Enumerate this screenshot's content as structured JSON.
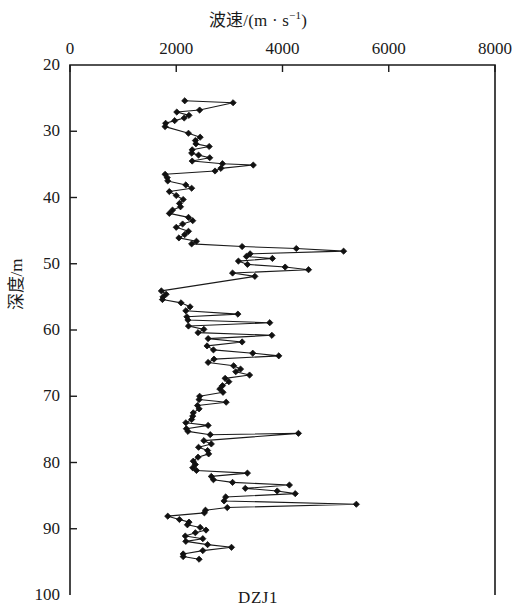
{
  "figure": {
    "caption": "DZJ1",
    "background": "#ffffff",
    "line_color": "#1a1a1a",
    "marker_color": "#111111",
    "axis_color": "#1a1a1a"
  },
  "chart_data": {
    "type": "line",
    "title": "",
    "xlabel_parts": {
      "name": "波速",
      "sep": "/(m · s",
      "sup": "−1",
      "close": ")"
    },
    "xlabel": "波速/(m·s⁻¹)",
    "ylabel": "深度/m",
    "xlim": [
      0,
      8000
    ],
    "ylim": [
      100,
      20
    ],
    "y_inverted": true,
    "xticks": [
      0,
      2000,
      4000,
      6000,
      8000
    ],
    "xticklabels": [
      "0",
      "2000",
      "4000",
      "6000",
      "8000"
    ],
    "yticks": [
      20,
      30,
      40,
      50,
      60,
      70,
      80,
      90,
      100
    ],
    "yticklabels": [
      "20",
      "30",
      "40",
      "50",
      "60",
      "70",
      "80",
      "90",
      "100"
    ],
    "grid": false,
    "legend": null,
    "legend_position": "none",
    "marker": "diamond",
    "series": [
      {
        "name": "DZJ1",
        "xkey": "velocity_m_per_s",
        "ykey": "depth_m",
        "points": [
          [
            2160,
            25.4
          ],
          [
            3070,
            25.7
          ],
          [
            2440,
            26.8
          ],
          [
            2010,
            27.1
          ],
          [
            2240,
            27.6
          ],
          [
            2150,
            28.0
          ],
          [
            1970,
            28.4
          ],
          [
            1800,
            28.8
          ],
          [
            1790,
            29.3
          ],
          [
            2230,
            30.3
          ],
          [
            2450,
            30.9
          ],
          [
            2360,
            31.4
          ],
          [
            2370,
            31.9
          ],
          [
            2620,
            32.3
          ],
          [
            2300,
            32.8
          ],
          [
            2290,
            33.3
          ],
          [
            2420,
            33.6
          ],
          [
            2630,
            34.0
          ],
          [
            2300,
            34.5
          ],
          [
            2870,
            34.9
          ],
          [
            3450,
            35.1
          ],
          [
            2840,
            35.6
          ],
          [
            2730,
            36.0
          ],
          [
            1790,
            36.5
          ],
          [
            1830,
            37.0
          ],
          [
            1840,
            37.5
          ],
          [
            2180,
            38.1
          ],
          [
            2290,
            38.6
          ],
          [
            1870,
            39.1
          ],
          [
            2000,
            39.7
          ],
          [
            2130,
            40.3
          ],
          [
            2060,
            40.9
          ],
          [
            2080,
            41.4
          ],
          [
            1930,
            41.9
          ],
          [
            1870,
            42.4
          ],
          [
            2230,
            43.0
          ],
          [
            2310,
            43.5
          ],
          [
            2120,
            44.0
          ],
          [
            2000,
            44.5
          ],
          [
            2230,
            45.1
          ],
          [
            2160,
            45.6
          ],
          [
            2050,
            46.1
          ],
          [
            2380,
            46.6
          ],
          [
            2290,
            47.0
          ],
          [
            3240,
            47.4
          ],
          [
            4260,
            47.7
          ],
          [
            5150,
            48.1
          ],
          [
            3390,
            48.5
          ],
          [
            3320,
            48.9
          ],
          [
            3810,
            49.2
          ],
          [
            3170,
            49.6
          ],
          [
            3340,
            50.1
          ],
          [
            4050,
            50.5
          ],
          [
            4490,
            50.9
          ],
          [
            3060,
            51.4
          ],
          [
            3480,
            51.9
          ],
          [
            1720,
            54.1
          ],
          [
            1810,
            54.6
          ],
          [
            1750,
            55.0
          ],
          [
            1740,
            55.4
          ],
          [
            2090,
            55.9
          ],
          [
            2260,
            56.5
          ],
          [
            2180,
            57.1
          ],
          [
            3160,
            57.6
          ],
          [
            2200,
            58.0
          ],
          [
            2220,
            58.5
          ],
          [
            3760,
            58.9
          ],
          [
            2230,
            59.4
          ],
          [
            2520,
            59.9
          ],
          [
            2410,
            60.4
          ],
          [
            3800,
            60.8
          ],
          [
            2600,
            61.3
          ],
          [
            3240,
            61.8
          ],
          [
            2580,
            62.4
          ],
          [
            2700,
            63.0
          ],
          [
            3440,
            63.5
          ],
          [
            3930,
            63.9
          ],
          [
            2710,
            64.4
          ],
          [
            2600,
            64.9
          ],
          [
            3080,
            65.4
          ],
          [
            3210,
            65.9
          ],
          [
            3120,
            66.3
          ],
          [
            3380,
            66.8
          ],
          [
            2920,
            67.3
          ],
          [
            2990,
            67.8
          ],
          [
            2870,
            68.4
          ],
          [
            2820,
            68.9
          ],
          [
            2880,
            69.4
          ],
          [
            2440,
            70.0
          ],
          [
            2430,
            70.5
          ],
          [
            2940,
            70.9
          ],
          [
            2400,
            71.4
          ],
          [
            2430,
            71.9
          ],
          [
            2320,
            72.5
          ],
          [
            2310,
            73.0
          ],
          [
            2290,
            73.5
          ],
          [
            2180,
            74.0
          ],
          [
            2600,
            74.4
          ],
          [
            2190,
            74.9
          ],
          [
            2220,
            75.3
          ],
          [
            2640,
            75.8
          ],
          [
            4300,
            75.6
          ],
          [
            2520,
            76.7
          ],
          [
            2660,
            77.2
          ],
          [
            2420,
            77.7
          ],
          [
            2590,
            78.2
          ],
          [
            2610,
            78.7
          ],
          [
            2410,
            79.2
          ],
          [
            2320,
            79.8
          ],
          [
            2360,
            80.3
          ],
          [
            2310,
            80.8
          ],
          [
            2380,
            81.2
          ],
          [
            3340,
            81.6
          ],
          [
            2660,
            82.1
          ],
          [
            2700,
            82.6
          ],
          [
            3060,
            83.0
          ],
          [
            4130,
            83.4
          ],
          [
            3300,
            83.9
          ],
          [
            3900,
            84.3
          ],
          [
            4240,
            84.7
          ],
          [
            2930,
            85.2
          ],
          [
            2900,
            85.8
          ],
          [
            5390,
            86.3
          ],
          [
            2960,
            86.8
          ],
          [
            2550,
            87.2
          ],
          [
            2530,
            87.6
          ],
          [
            1840,
            88.1
          ],
          [
            2060,
            88.6
          ],
          [
            2240,
            89.0
          ],
          [
            2210,
            89.4
          ],
          [
            2450,
            89.8
          ],
          [
            2560,
            90.2
          ],
          [
            2360,
            90.6
          ],
          [
            2170,
            91.1
          ],
          [
            2500,
            91.5
          ],
          [
            2180,
            91.9
          ],
          [
            2590,
            92.4
          ],
          [
            3040,
            92.8
          ],
          [
            2500,
            93.3
          ],
          [
            2130,
            93.8
          ],
          [
            2130,
            94.2
          ],
          [
            2430,
            94.6
          ]
        ]
      }
    ]
  },
  "plot_geometry": {
    "left_px": 70,
    "right_px": 495,
    "top_px": 65,
    "bottom_px": 595
  }
}
